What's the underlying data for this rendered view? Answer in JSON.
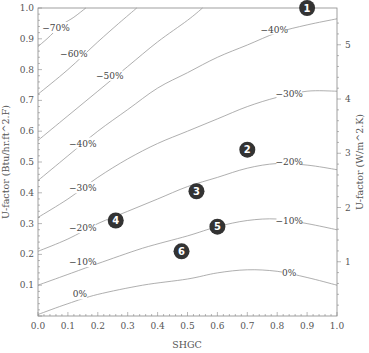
{
  "chart_data": {
    "type": "line",
    "subtype": "contour",
    "title": "",
    "xlabel": "SHGC",
    "ylabel": "U-factor (Btu/hr.ft^2.F)",
    "y2label": "U-factor (W/m^2.K)",
    "xlim": [
      0,
      1
    ],
    "ylim": [
      0,
      1
    ],
    "y2_conversion_factor": 5.678,
    "x_ticks": [
      "0.0",
      "0.1",
      "0.2",
      "0.3",
      "0.4",
      "0.5",
      "0.6",
      "0.7",
      "0.8",
      "0.9",
      "1.0"
    ],
    "y_ticks": [
      "0.1",
      "0.2",
      "0.3",
      "0.4",
      "0.5",
      "0.6",
      "0.7",
      "0.8",
      "0.9",
      "1.0"
    ],
    "y2_ticks": [
      "1",
      "2",
      "3",
      "4",
      "5"
    ],
    "grid": false,
    "colors": {
      "line": "#9a9a9a",
      "frame": "#888888",
      "marker": "#333333"
    },
    "series": [
      {
        "name": "0%",
        "label": "0%",
        "label_at": [
          0.14,
          0.07
        ],
        "end_label_at": [
          0.84,
          0.14
        ],
        "points": [
          [
            0,
            0.005
          ],
          [
            0.1,
            0.04
          ],
          [
            0.2,
            0.07
          ],
          [
            0.35,
            0.1
          ],
          [
            0.5,
            0.12
          ],
          [
            0.6,
            0.14
          ],
          [
            0.7,
            0.15
          ],
          [
            0.8,
            0.145
          ],
          [
            0.9,
            0.125
          ],
          [
            1.0,
            0.1
          ]
        ]
      },
      {
        "name": "-10%",
        "label": "−10%",
        "label_at": [
          0.15,
          0.175
        ],
        "end_label_at": [
          0.84,
          0.31
        ],
        "points": [
          [
            0,
            0.1
          ],
          [
            0.1,
            0.135
          ],
          [
            0.2,
            0.17
          ],
          [
            0.35,
            0.22
          ],
          [
            0.5,
            0.26
          ],
          [
            0.6,
            0.29
          ],
          [
            0.7,
            0.31
          ],
          [
            0.8,
            0.315
          ],
          [
            0.9,
            0.3
          ],
          [
            1.0,
            0.28
          ]
        ]
      },
      {
        "name": "-20%",
        "label": "−20%",
        "label_at": [
          0.15,
          0.285
        ],
        "end_label_at": [
          0.84,
          0.5
        ],
        "points": [
          [
            0,
            0.21
          ],
          [
            0.1,
            0.25
          ],
          [
            0.2,
            0.3
          ],
          [
            0.3,
            0.34
          ],
          [
            0.4,
            0.38
          ],
          [
            0.5,
            0.42
          ],
          [
            0.6,
            0.45
          ],
          [
            0.7,
            0.48
          ],
          [
            0.8,
            0.495
          ],
          [
            0.9,
            0.49
          ],
          [
            1.0,
            0.475
          ]
        ]
      },
      {
        "name": "-30%",
        "label": "−30%",
        "label_at": [
          0.15,
          0.415
        ],
        "end_label_at": [
          0.84,
          0.72
        ],
        "points": [
          [
            0,
            0.32
          ],
          [
            0.1,
            0.38
          ],
          [
            0.2,
            0.45
          ],
          [
            0.3,
            0.51
          ],
          [
            0.4,
            0.56
          ],
          [
            0.5,
            0.6
          ],
          [
            0.6,
            0.64
          ],
          [
            0.7,
            0.68
          ],
          [
            0.8,
            0.71
          ],
          [
            0.9,
            0.73
          ],
          [
            1.0,
            0.73
          ]
        ]
      },
      {
        "name": "-40%",
        "label": "−40%",
        "label_at": [
          0.15,
          0.56
        ],
        "end_label_at": [
          0.79,
          0.93
        ],
        "points": [
          [
            0,
            0.44
          ],
          [
            0.1,
            0.52
          ],
          [
            0.2,
            0.6
          ],
          [
            0.3,
            0.67
          ],
          [
            0.4,
            0.74
          ],
          [
            0.5,
            0.79
          ],
          [
            0.6,
            0.84
          ],
          [
            0.7,
            0.88
          ],
          [
            0.8,
            0.92
          ],
          [
            0.9,
            0.945
          ],
          [
            1.0,
            0.965
          ]
        ]
      },
      {
        "name": "-50%",
        "label": "−50%",
        "label_at": [
          0.24,
          0.78
        ],
        "points": [
          [
            0,
            0.57
          ],
          [
            0.1,
            0.65
          ],
          [
            0.2,
            0.73
          ],
          [
            0.3,
            0.81
          ],
          [
            0.4,
            0.89
          ],
          [
            0.5,
            0.96
          ],
          [
            0.55,
            1.0
          ]
        ]
      },
      {
        "name": "-60%",
        "label": "−60%",
        "label_at": [
          0.12,
          0.85
        ],
        "points": [
          [
            0,
            0.72
          ],
          [
            0.1,
            0.8
          ],
          [
            0.2,
            0.89
          ],
          [
            0.27,
            0.95
          ],
          [
            0.33,
            1.0
          ]
        ]
      },
      {
        "name": "-70%",
        "label": "−70%",
        "label_at": [
          0.06,
          0.935
        ],
        "points": [
          [
            0,
            0.875
          ],
          [
            0.03,
            0.9
          ],
          [
            0.08,
            0.945
          ],
          [
            0.12,
            0.97
          ],
          [
            0.16,
            1.0
          ]
        ]
      }
    ],
    "markers": [
      {
        "id": "1",
        "x": 0.9,
        "y": 1.0
      },
      {
        "id": "2",
        "x": 0.7,
        "y": 0.54
      },
      {
        "id": "3",
        "x": 0.53,
        "y": 0.405
      },
      {
        "id": "4",
        "x": 0.26,
        "y": 0.31
      },
      {
        "id": "5",
        "x": 0.6,
        "y": 0.29
      },
      {
        "id": "6",
        "x": 0.48,
        "y": 0.21
      }
    ]
  }
}
